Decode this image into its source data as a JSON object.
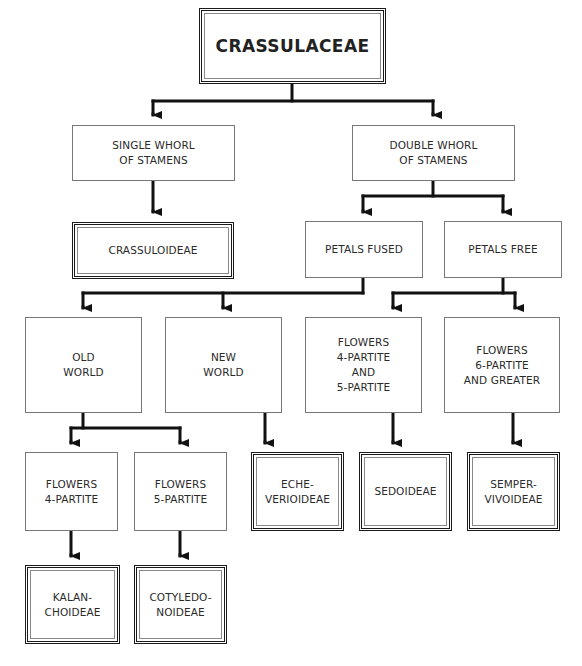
{
  "diagram": {
    "type": "taxonomic-key",
    "root": {
      "id": "crassulaceae",
      "label": "CRASSULACEAE",
      "terminal": true
    },
    "nodes": [
      {
        "id": "single-whorl",
        "label": "SINGLE WHORL\nOF STAMENS",
        "terminal": false
      },
      {
        "id": "double-whorl",
        "label": "DOUBLE WHORL\nOF STAMENS",
        "terminal": false
      },
      {
        "id": "crassuloideae",
        "label": "CRASSULOIDEAE",
        "terminal": true
      },
      {
        "id": "petals-fused",
        "label": "PETALS FUSED",
        "terminal": false
      },
      {
        "id": "petals-free",
        "label": "PETALS FREE",
        "terminal": false
      },
      {
        "id": "old-world",
        "label": "OLD\nWORLD",
        "terminal": false
      },
      {
        "id": "new-world",
        "label": "NEW\nWORLD",
        "terminal": false
      },
      {
        "id": "flowers-4-5-partite",
        "label": "FLOWERS\n4-PARTITE\nAND\n5-PARTITE",
        "terminal": false
      },
      {
        "id": "flowers-6-partite",
        "label": "FLOWERS\n6-PARTITE\nAND GREATER",
        "terminal": false
      },
      {
        "id": "flowers-4-partite",
        "label": "FLOWERS\n4-PARTITE",
        "terminal": false
      },
      {
        "id": "flowers-5-partite",
        "label": "FLOWERS\n5-PARTITE",
        "terminal": false
      },
      {
        "id": "echeverioideae",
        "label": "ECHE-\nVERIOIDEAE",
        "terminal": true
      },
      {
        "id": "sedoideae",
        "label": "SEDOIDEAE",
        "terminal": true
      },
      {
        "id": "sempervivoideae",
        "label": "SEMPER-\nVIVOIDEAE",
        "terminal": true
      },
      {
        "id": "kalanchoideae",
        "label": "KALAN-\nCHOIDEAE",
        "terminal": true
      },
      {
        "id": "cotyledonoideae",
        "label": "COTYLEDO-\nNOIDEAE",
        "terminal": true
      }
    ],
    "edges": [
      [
        "crassulaceae",
        "single-whorl"
      ],
      [
        "crassulaceae",
        "double-whorl"
      ],
      [
        "single-whorl",
        "crassuloideae"
      ],
      [
        "double-whorl",
        "petals-fused"
      ],
      [
        "double-whorl",
        "petals-free"
      ],
      [
        "petals-fused",
        "old-world"
      ],
      [
        "petals-fused",
        "new-world"
      ],
      [
        "petals-free",
        "flowers-4-5-partite"
      ],
      [
        "petals-free",
        "flowers-6-partite"
      ],
      [
        "old-world",
        "flowers-4-partite"
      ],
      [
        "old-world",
        "flowers-5-partite"
      ],
      [
        "new-world",
        "echeverioideae"
      ],
      [
        "flowers-4-5-partite",
        "sedoideae"
      ],
      [
        "flowers-6-partite",
        "sempervivoideae"
      ],
      [
        "flowers-4-partite",
        "kalanchoideae"
      ],
      [
        "flowers-5-partite",
        "cotyledonoideae"
      ]
    ],
    "colors": {
      "line": "#111111",
      "box_border": "#777777",
      "terminal_border": "#1a1a1a",
      "text": "#2a2a2a",
      "background": "#ffffff"
    }
  }
}
